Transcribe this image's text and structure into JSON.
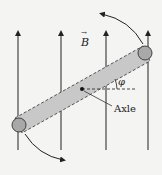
{
  "diagram": {
    "field_label": "B",
    "field_vector_mark": "→",
    "angle_label": "φ",
    "axle_label": "Axle",
    "field_direction": "up",
    "field_line_count": 4,
    "rotation_direction": "counterclockwise",
    "colors": {
      "background": "#f4f4f2",
      "line": "#222222",
      "rod_fill": "#c8c8c8",
      "sphere_fill": "#a8a8a8"
    }
  }
}
